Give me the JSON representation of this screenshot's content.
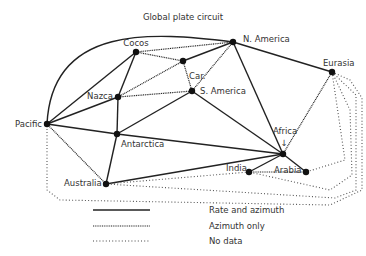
{
  "title": "Global plate circuit",
  "nodes": [
    {
      "id": "pacific",
      "label": "Pacific"
    },
    {
      "id": "cocos",
      "label": "Cocos"
    },
    {
      "id": "car",
      "label": "Car."
    },
    {
      "id": "namerica",
      "label": "N. America"
    },
    {
      "id": "nazca",
      "label": "Nazca"
    },
    {
      "id": "samerica",
      "label": "S. America"
    },
    {
      "id": "antarctica",
      "label": "Antarctica"
    },
    {
      "id": "africa",
      "label": "Africa"
    },
    {
      "id": "eurasia",
      "label": "Eurasia"
    },
    {
      "id": "arabia",
      "label": "Arabia"
    },
    {
      "id": "india",
      "label": "India"
    },
    {
      "id": "australia",
      "label": "Australia"
    }
  ],
  "africa_arrow": "↓",
  "edges": [
    {
      "from": "pacific",
      "to": "namerica",
      "type": "rate",
      "curved": true
    },
    {
      "from": "pacific",
      "to": "cocos",
      "type": "rate"
    },
    {
      "from": "pacific",
      "to": "nazca",
      "type": "rate"
    },
    {
      "from": "pacific",
      "to": "antarctica",
      "type": "rate"
    },
    {
      "from": "pacific",
      "to": "australia",
      "type": "azimuth"
    },
    {
      "from": "cocos",
      "to": "nazca",
      "type": "rate"
    },
    {
      "from": "cocos",
      "to": "namerica",
      "type": "azimuth"
    },
    {
      "from": "cocos",
      "to": "car",
      "type": "azimuth"
    },
    {
      "from": "car",
      "to": "namerica",
      "type": "rate"
    },
    {
      "from": "car",
      "to": "samerica",
      "type": "azimuth"
    },
    {
      "from": "nazca",
      "to": "car",
      "type": "azimuth"
    },
    {
      "from": "nazca",
      "to": "samerica",
      "type": "azimuth"
    },
    {
      "from": "nazca",
      "to": "antarctica",
      "type": "rate"
    },
    {
      "from": "namerica",
      "to": "samerica",
      "type": "azimuth"
    },
    {
      "from": "namerica",
      "to": "africa",
      "type": "rate"
    },
    {
      "from": "namerica",
      "to": "eurasia",
      "type": "rate"
    },
    {
      "from": "samerica",
      "to": "antarctica",
      "type": "rate"
    },
    {
      "from": "samerica",
      "to": "africa",
      "type": "rate"
    },
    {
      "from": "antarctica",
      "to": "africa",
      "type": "rate"
    },
    {
      "from": "antarctica",
      "to": "australia",
      "type": "rate"
    },
    {
      "from": "australia",
      "to": "africa",
      "type": "rate"
    },
    {
      "from": "africa",
      "to": "eurasia",
      "type": "azimuth"
    },
    {
      "from": "africa",
      "to": "arabia",
      "type": "rate"
    },
    {
      "from": "africa",
      "to": "india",
      "type": "rate"
    },
    {
      "from": "arabia",
      "to": "india",
      "type": "azimuth"
    },
    {
      "from": "eurasia",
      "to": "arabia",
      "type": "nodata"
    },
    {
      "from": "eurasia",
      "to": "india",
      "type": "nodata"
    },
    {
      "from": "eurasia",
      "to": "australia",
      "type": "nodata"
    },
    {
      "from": "eurasia",
      "to": "pacific",
      "type": "nodata"
    },
    {
      "from": "india",
      "to": "australia",
      "type": "nodata"
    }
  ],
  "legend": [
    {
      "type": "rate",
      "label": "Rate and azimuth"
    },
    {
      "type": "azimuth",
      "label": "Azimuth only"
    },
    {
      "type": "nodata",
      "label": "No data"
    }
  ]
}
